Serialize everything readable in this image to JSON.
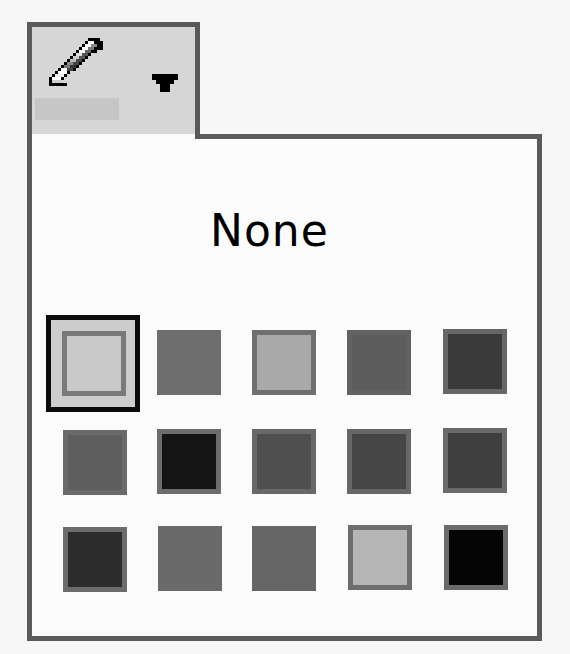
{
  "tool_button": {
    "icon": "pencil-icon",
    "dropdown_icon": "dropdown-arrow-icon",
    "current_color_label": "",
    "current_color": "#c6c6c6"
  },
  "palette": {
    "none_label": "None",
    "selected_index": 0,
    "swatches": [
      {
        "name": "swatch-none",
        "fill": "#c9c9c9",
        "border": "#7a7a7a",
        "x": 62,
        "y": 331
      },
      {
        "name": "swatch-2",
        "fill": "#6e6e6e",
        "border": "#6e6e6e",
        "x": 157,
        "y": 330
      },
      {
        "name": "swatch-3",
        "fill": "#a9a9a9",
        "border": "#6f6f6f",
        "x": 252,
        "y": 330
      },
      {
        "name": "swatch-4",
        "fill": "#5d5d5d",
        "border": "#626262",
        "x": 347,
        "y": 330
      },
      {
        "name": "swatch-5",
        "fill": "#3a3a3a",
        "border": "#666666",
        "x": 443,
        "y": 329
      },
      {
        "name": "swatch-6",
        "fill": "#5e5e5e",
        "border": "#6a6a6a",
        "x": 63,
        "y": 430
      },
      {
        "name": "swatch-7",
        "fill": "#141414",
        "border": "#6d6d6d",
        "x": 157,
        "y": 429
      },
      {
        "name": "swatch-8",
        "fill": "#4f4f4f",
        "border": "#686868",
        "x": 252,
        "y": 429
      },
      {
        "name": "swatch-9",
        "fill": "#464646",
        "border": "#676767",
        "x": 347,
        "y": 429
      },
      {
        "name": "swatch-10",
        "fill": "#3f3f3f",
        "border": "#6a6a6a",
        "x": 443,
        "y": 428
      },
      {
        "name": "swatch-11",
        "fill": "#2c2c2c",
        "border": "#6c6c6c",
        "x": 63,
        "y": 527
      },
      {
        "name": "swatch-12",
        "fill": "#6a6a6a",
        "border": "#6a6a6a",
        "x": 158,
        "y": 526
      },
      {
        "name": "swatch-13",
        "fill": "#666666",
        "border": "#666666",
        "x": 252,
        "y": 526
      },
      {
        "name": "swatch-14",
        "fill": "#b5b5b5",
        "border": "#6e6e6e",
        "x": 348,
        "y": 525
      },
      {
        "name": "swatch-15",
        "fill": "#050505",
        "border": "#6b6b6b",
        "x": 444,
        "y": 525
      }
    ]
  }
}
